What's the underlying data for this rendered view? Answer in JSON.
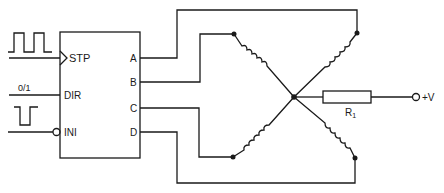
{
  "diagram": {
    "type": "stepper-motor-driver-schematic",
    "driver_block": {
      "inputs": [
        {
          "label": "STP",
          "signal": "pulse-train",
          "marker": "clock-triangle"
        },
        {
          "label": "DIR",
          "signal_label": "0/1"
        },
        {
          "label": "INI",
          "signal": "low-pulse",
          "marker": "inversion-bubble"
        }
      ],
      "outputs": [
        "A",
        "B",
        "C",
        "D"
      ]
    },
    "components": {
      "resistor_label": "R",
      "resistor_subscript": "1",
      "supply_label": "+V"
    },
    "colors": {
      "line": "#1a1a1a",
      "background": "#ffffff"
    }
  }
}
